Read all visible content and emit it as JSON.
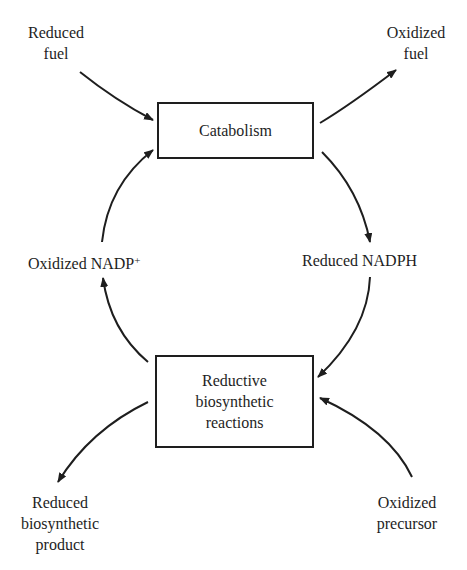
{
  "diagram": {
    "nodes": {
      "catabolism": {
        "label": "Catabolism"
      },
      "reductive": {
        "lines": [
          "Reductive",
          "biosynthetic",
          "reactions"
        ]
      }
    },
    "labels": {
      "reduced_fuel": [
        "Reduced",
        "fuel"
      ],
      "oxidized_fuel": [
        "Oxidized",
        "fuel"
      ],
      "oxidized_nadp": {
        "text": "Oxidized NADP",
        "sup": "+"
      },
      "reduced_nadph": "Reduced NADPH",
      "reduced_product": [
        "Reduced",
        "biosynthetic",
        "product"
      ],
      "oxidized_precursor": [
        "Oxidized",
        "precursor"
      ]
    },
    "edges": [
      {
        "from": "Reduced fuel",
        "to": "Catabolism"
      },
      {
        "from": "Catabolism",
        "to": "Oxidized fuel"
      },
      {
        "from": "Catabolism",
        "to": "Reduced NADPH"
      },
      {
        "from": "Reduced NADPH",
        "to": "Reductive biosynthetic reactions"
      },
      {
        "from": "Oxidized precursor",
        "to": "Reductive biosynthetic reactions"
      },
      {
        "from": "Reductive biosynthetic reactions",
        "to": "Reduced biosynthetic product"
      },
      {
        "from": "Reductive biosynthetic reactions",
        "to": "Oxidized NADP+"
      },
      {
        "from": "Oxidized NADP+",
        "to": "Catabolism"
      }
    ],
    "line_color": "#1e1e1e"
  }
}
